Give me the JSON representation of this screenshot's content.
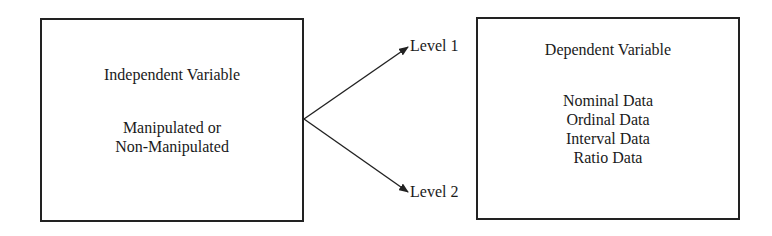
{
  "diagram": {
    "independent_variable": {
      "title": "Independent Variable",
      "lines": [
        "Manipulated or",
        "Non-Manipulated"
      ]
    },
    "levels": [
      {
        "label": "Level 1"
      },
      {
        "label": "Level 2"
      }
    ],
    "dependent_variable": {
      "title": "Dependent Variable",
      "lines": [
        "Nominal Data",
        "Ordinal Data",
        "Interval Data",
        "Ratio Data"
      ]
    },
    "colors": {
      "stroke": "#222222",
      "background": "#ffffff",
      "text": "#1a1a1a"
    }
  }
}
